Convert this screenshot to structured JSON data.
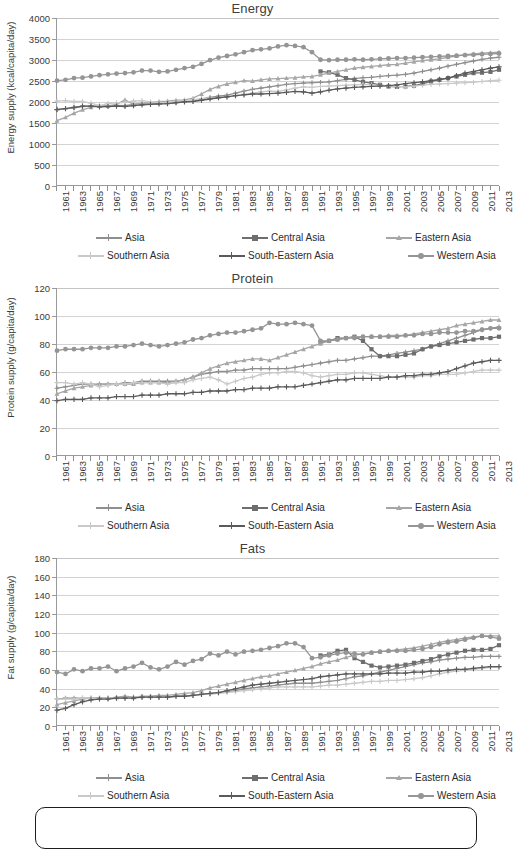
{
  "figure": {
    "background": "#ffffff",
    "panel_count": 3
  },
  "series_styles": {
    "Asia": {
      "color": "#8f8f8f",
      "marker": "plus-diamond"
    },
    "Central Asia": {
      "color": "#6e6e6e",
      "marker": "square"
    },
    "Eastern Asia": {
      "color": "#a6a6a6",
      "marker": "triangle"
    },
    "Southern Asia": {
      "color": "#c9c9c9",
      "marker": "cross"
    },
    "South-Eastern Asia": {
      "color": "#5a5a5a",
      "marker": "star"
    },
    "Western Asia": {
      "color": "#959595",
      "marker": "circle"
    }
  },
  "legend": {
    "position": "bottom",
    "rows": [
      [
        "Asia",
        "Central Asia",
        "Eastern Asia"
      ],
      [
        "Southern Asia",
        "South-Eastern Asia",
        "Western Asia"
      ]
    ]
  },
  "years": [
    1961,
    1962,
    1963,
    1964,
    1965,
    1966,
    1967,
    1968,
    1969,
    1970,
    1971,
    1972,
    1973,
    1974,
    1975,
    1976,
    1977,
    1978,
    1979,
    1980,
    1981,
    1982,
    1983,
    1984,
    1985,
    1986,
    1987,
    1988,
    1989,
    1990,
    1991,
    1992,
    1993,
    1994,
    1995,
    1996,
    1997,
    1998,
    1999,
    2000,
    2001,
    2002,
    2003,
    2004,
    2005,
    2006,
    2007,
    2008,
    2009,
    2010,
    2011,
    2012,
    2013
  ],
  "tick_labels": [
    1961,
    1963,
    1965,
    1967,
    1969,
    1971,
    1973,
    1975,
    1977,
    1979,
    1981,
    1983,
    1985,
    1987,
    1989,
    1991,
    1993,
    1995,
    1997,
    1999,
    2001,
    2003,
    2005,
    2007,
    2009,
    2011,
    2013
  ],
  "chart_data": [
    {
      "type": "line",
      "id": "energy",
      "title": "Energy",
      "xlabel": "",
      "ylabel": "Energy supply (kcal/capita/day)",
      "ylim": [
        0,
        4000
      ],
      "ystep": 500,
      "yticks": [
        0,
        500,
        1000,
        1500,
        2000,
        2500,
        3000,
        3500,
        4000
      ],
      "xlim": [
        1961,
        2013
      ],
      "grid": true,
      "legend_position": "bottom",
      "series": [
        {
          "name": "Asia",
          "start_year": 1961,
          "values": [
            1800,
            1830,
            1850,
            1880,
            1890,
            1890,
            1900,
            1905,
            1900,
            1930,
            1950,
            1950,
            1955,
            1960,
            1980,
            2000,
            2010,
            2060,
            2100,
            2130,
            2150,
            2200,
            2250,
            2290,
            2320,
            2350,
            2380,
            2410,
            2430,
            2440,
            2450,
            2460,
            2470,
            2500,
            2530,
            2550,
            2570,
            2580,
            2600,
            2620,
            2630,
            2650,
            2680,
            2720,
            2760,
            2800,
            2850,
            2890,
            2930,
            2970,
            3010,
            3040,
            3060
          ]
        },
        {
          "name": "Central Asia",
          "start_year": 1992,
          "values": [
            2720,
            2700,
            2640,
            2560,
            2520,
            2470,
            2440,
            2400,
            2360,
            2350,
            2360,
            2380,
            2420,
            2480,
            2520,
            2560,
            2600,
            2640,
            2680,
            2690,
            2710,
            2760,
            2800,
            2840
          ]
        },
        {
          "name": "Eastern Asia",
          "start_year": 1961,
          "values": [
            1540,
            1620,
            1720,
            1800,
            1860,
            1900,
            1890,
            1930,
            2040,
            1930,
            1960,
            1970,
            2000,
            2010,
            2030,
            2040,
            2080,
            2180,
            2290,
            2360,
            2420,
            2460,
            2500,
            2490,
            2520,
            2540,
            2550,
            2560,
            2570,
            2590,
            2600,
            2640,
            2680,
            2720,
            2760,
            2800,
            2820,
            2840,
            2860,
            2880,
            2890,
            2920,
            2950,
            2980,
            3000,
            3020,
            3060,
            3090,
            3120,
            3140,
            3160,
            3170,
            3180
          ]
        },
        {
          "name": "Southern Asia",
          "start_year": 1961,
          "values": [
            2010,
            2020,
            2000,
            2000,
            1960,
            1900,
            1950,
            1970,
            1980,
            2010,
            2020,
            1990,
            1980,
            1960,
            2010,
            2020,
            2040,
            2070,
            2080,
            2090,
            2110,
            2140,
            2170,
            2200,
            2230,
            2250,
            2240,
            2280,
            2320,
            2350,
            2340,
            2360,
            2370,
            2380,
            2390,
            2400,
            2410,
            2400,
            2380,
            2370,
            2360,
            2350,
            2370,
            2390,
            2410,
            2420,
            2430,
            2440,
            2450,
            2460,
            2480,
            2500,
            2510
          ]
        },
        {
          "name": "South-Eastern Asia",
          "start_year": 1961,
          "values": [
            1810,
            1830,
            1860,
            1890,
            1890,
            1870,
            1880,
            1890,
            1880,
            1900,
            1920,
            1930,
            1940,
            1950,
            1970,
            1990,
            2000,
            2030,
            2060,
            2090,
            2110,
            2140,
            2160,
            2180,
            2180,
            2190,
            2200,
            2220,
            2240,
            2230,
            2200,
            2230,
            2270,
            2300,
            2320,
            2340,
            2350,
            2360,
            2370,
            2380,
            2400,
            2430,
            2450,
            2470,
            2500,
            2530,
            2560,
            2620,
            2680,
            2720,
            2760,
            2800,
            2830
          ]
        },
        {
          "name": "Western Asia",
          "start_year": 1961,
          "values": [
            2500,
            2520,
            2560,
            2570,
            2600,
            2630,
            2650,
            2670,
            2680,
            2700,
            2740,
            2740,
            2710,
            2720,
            2760,
            2800,
            2830,
            2900,
            2990,
            3050,
            3090,
            3130,
            3180,
            3230,
            3250,
            3270,
            3320,
            3350,
            3330,
            3300,
            3180,
            3000,
            2990,
            3000,
            3000,
            3010,
            3000,
            3010,
            3020,
            3030,
            3040,
            3040,
            3050,
            3060,
            3070,
            3080,
            3090,
            3100,
            3110,
            3120,
            3130,
            3140,
            3150
          ]
        }
      ]
    },
    {
      "type": "line",
      "id": "protein",
      "title": "Protein",
      "xlabel": "",
      "ylabel": "Protein supply (g/capita/day)",
      "ylim": [
        0,
        120
      ],
      "ystep": 20,
      "yticks": [
        0,
        20,
        40,
        60,
        80,
        100,
        120
      ],
      "xlim": [
        1961,
        2013
      ],
      "grid": true,
      "legend_position": "bottom",
      "series": [
        {
          "name": "Asia",
          "start_year": 1961,
          "values": [
            48,
            49,
            50,
            51,
            51,
            51,
            51,
            51,
            52,
            52,
            53,
            53,
            53,
            53,
            53,
            54,
            56,
            58,
            59,
            60,
            60,
            61,
            61,
            62,
            62,
            62,
            62,
            62,
            63,
            64,
            65,
            66,
            67,
            68,
            68,
            69,
            70,
            71,
            71,
            72,
            73,
            74,
            75,
            76,
            78,
            80,
            82,
            84,
            86,
            88,
            90,
            91,
            92
          ]
        },
        {
          "name": "Central Asia",
          "start_year": 1992,
          "values": [
            81,
            82,
            84,
            84,
            85,
            82,
            76,
            71,
            71,
            71,
            72,
            73,
            76,
            78,
            79,
            80,
            81,
            82,
            83,
            84,
            84,
            85,
            85,
            86
          ]
        },
        {
          "name": "Eastern Asia",
          "start_year": 1961,
          "values": [
            44,
            46,
            48,
            49,
            50,
            51,
            51,
            51,
            51,
            51,
            52,
            52,
            52,
            52,
            53,
            54,
            56,
            59,
            62,
            64,
            66,
            67,
            68,
            69,
            69,
            68,
            70,
            72,
            74,
            76,
            78,
            80,
            82,
            83,
            84,
            85,
            85,
            85,
            85,
            86,
            86,
            86,
            87,
            88,
            89,
            90,
            91,
            93,
            94,
            95,
            96,
            97,
            97
          ]
        },
        {
          "name": "Southern Asia",
          "start_year": 1961,
          "values": [
            52,
            52,
            51,
            52,
            51,
            49,
            50,
            51,
            51,
            52,
            52,
            52,
            52,
            51,
            52,
            52,
            54,
            55,
            56,
            54,
            51,
            53,
            55,
            56,
            58,
            59,
            59,
            60,
            60,
            59,
            57,
            56,
            57,
            58,
            58,
            59,
            59,
            58,
            57,
            56,
            56,
            56,
            56,
            57,
            57,
            58,
            58,
            58,
            59,
            60,
            61,
            61,
            61
          ]
        },
        {
          "name": "South-Eastern Asia",
          "start_year": 1961,
          "values": [
            39,
            40,
            40,
            40,
            41,
            41,
            41,
            42,
            42,
            42,
            43,
            43,
            43,
            44,
            44,
            44,
            45,
            45,
            46,
            46,
            46,
            47,
            47,
            48,
            48,
            48,
            49,
            49,
            49,
            50,
            51,
            52,
            53,
            54,
            54,
            55,
            55,
            55,
            55,
            56,
            56,
            57,
            57,
            58,
            58,
            59,
            60,
            62,
            64,
            66,
            67,
            68,
            68
          ]
        },
        {
          "name": "Western Asia",
          "start_year": 1961,
          "values": [
            75,
            76,
            76,
            76,
            77,
            77,
            77,
            78,
            78,
            79,
            80,
            79,
            78,
            79,
            80,
            81,
            83,
            84,
            86,
            87,
            88,
            88,
            89,
            90,
            91,
            95,
            94,
            94,
            95,
            94,
            93,
            82,
            82,
            83,
            84,
            84,
            85,
            85,
            85,
            85,
            85,
            86,
            86,
            87,
            87,
            88,
            88,
            88,
            89,
            89,
            90,
            91,
            91
          ]
        }
      ]
    },
    {
      "type": "line",
      "id": "fats",
      "title": "Fats",
      "xlabel": "",
      "ylabel": "Fat supply (g/capita/day)",
      "ylim": [
        0,
        180
      ],
      "ystep": 20,
      "yticks": [
        0,
        20,
        40,
        60,
        80,
        100,
        120,
        140,
        160,
        180
      ],
      "xlim": [
        1961,
        2013
      ],
      "grid": true,
      "legend_position": "bottom",
      "series": [
        {
          "name": "Asia",
          "start_year": 1961,
          "values": [
            28,
            29,
            29,
            29,
            29,
            29,
            29,
            29,
            30,
            30,
            30,
            30,
            30,
            30,
            31,
            31,
            32,
            33,
            34,
            35,
            36,
            37,
            39,
            40,
            41,
            42,
            43,
            44,
            45,
            45,
            45,
            46,
            47,
            48,
            50,
            52,
            53,
            55,
            57,
            59,
            61,
            63,
            65,
            67,
            68,
            70,
            71,
            72,
            73,
            73,
            74,
            74,
            74
          ]
        },
        {
          "name": "Central Asia",
          "start_year": 1992,
          "values": [
            75,
            76,
            80,
            81,
            72,
            68,
            64,
            62,
            63,
            64,
            65,
            67,
            69,
            71,
            74,
            76,
            78,
            80,
            81,
            81,
            82,
            86,
            89,
            90
          ]
        },
        {
          "name": "Eastern Asia",
          "start_year": 1961,
          "values": [
            22,
            24,
            26,
            28,
            29,
            29,
            29,
            30,
            31,
            30,
            31,
            31,
            32,
            32,
            33,
            34,
            35,
            37,
            40,
            42,
            44,
            46,
            48,
            50,
            52,
            53,
            55,
            57,
            59,
            61,
            63,
            66,
            68,
            70,
            73,
            75,
            77,
            78,
            79,
            80,
            81,
            82,
            83,
            85,
            87,
            89,
            91,
            92,
            94,
            95,
            96,
            96,
            96
          ]
        },
        {
          "name": "Southern Asia",
          "start_year": 1961,
          "values": [
            28,
            28,
            28,
            29,
            29,
            28,
            29,
            29,
            29,
            30,
            30,
            30,
            30,
            30,
            31,
            31,
            32,
            33,
            33,
            34,
            35,
            36,
            37,
            38,
            39,
            40,
            41,
            41,
            41,
            41,
            41,
            42,
            43,
            43,
            44,
            45,
            46,
            47,
            47,
            48,
            48,
            49,
            50,
            51,
            53,
            55,
            57,
            58,
            59,
            60,
            61,
            62,
            62
          ]
        },
        {
          "name": "South-Eastern Asia",
          "start_year": 1961,
          "values": [
            16,
            18,
            22,
            25,
            27,
            28,
            28,
            29,
            29,
            29,
            30,
            30,
            30,
            30,
            31,
            31,
            32,
            33,
            34,
            35,
            37,
            39,
            41,
            43,
            44,
            45,
            46,
            47,
            48,
            49,
            50,
            52,
            53,
            54,
            55,
            55,
            55,
            55,
            55,
            56,
            56,
            56,
            57,
            57,
            58,
            58,
            59,
            60,
            60,
            61,
            62,
            63,
            63
          ]
        },
        {
          "name": "Western Asia",
          "start_year": 1961,
          "values": [
            57,
            55,
            60,
            58,
            61,
            61,
            63,
            58,
            61,
            63,
            67,
            62,
            60,
            63,
            68,
            65,
            69,
            71,
            77,
            75,
            79,
            76,
            79,
            80,
            81,
            83,
            85,
            88,
            88,
            84,
            72,
            73,
            75,
            77,
            78,
            77,
            76,
            78,
            79,
            80,
            80,
            80,
            81,
            82,
            84,
            87,
            89,
            90,
            92,
            94,
            96,
            95,
            93
          ]
        }
      ]
    }
  ]
}
